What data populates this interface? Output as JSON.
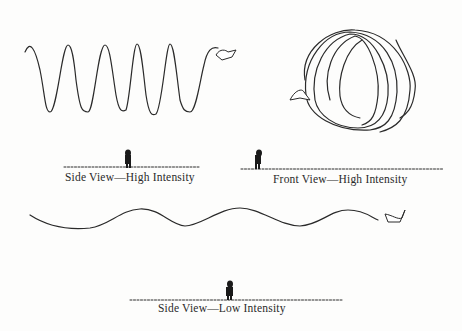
{
  "panels": [
    {
      "id": "side-high",
      "caption": "Side View—High Intensity"
    },
    {
      "id": "front-high",
      "caption": "Front View—High Intensity"
    },
    {
      "id": "side-low",
      "caption": "Side View—Low Intensity"
    }
  ],
  "colors": {
    "ink": "#2a2a2a",
    "background": "#fdfdfc"
  }
}
